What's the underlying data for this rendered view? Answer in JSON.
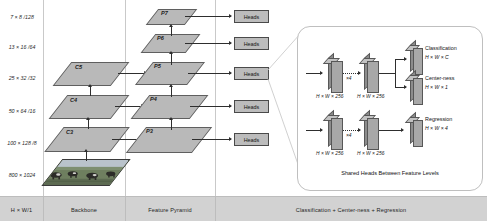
{
  "figure": {
    "accent_color": "#b9b9b9",
    "line_color": "#2e2e2e",
    "panel_border_color": "#bfbfbf"
  },
  "resolution_labels": [
    {
      "text": "7 × 8 /128"
    },
    {
      "text": "13 × 16 /64"
    },
    {
      "text": "25 × 32 /32"
    },
    {
      "text": "50 × 64 /16"
    },
    {
      "text": "100 × 128 /8"
    },
    {
      "text": "800 × 1024"
    }
  ],
  "backbone": {
    "levels": [
      {
        "label": "C5"
      },
      {
        "label": "C4"
      },
      {
        "label": "C3"
      }
    ],
    "input_image_alt": "input image"
  },
  "feature_pyramid": {
    "levels": [
      {
        "label": "P7"
      },
      {
        "label": "P6"
      },
      {
        "label": "P5"
      },
      {
        "label": "P4"
      },
      {
        "label": "P3"
      }
    ]
  },
  "heads": {
    "label": "Heads",
    "count": 5
  },
  "legend_bar": {
    "cells": [
      {
        "text": "H × W/1"
      },
      {
        "text": "Backbone"
      },
      {
        "text": "Feature Pyramid"
      },
      {
        "text": "Classification + Center-ness + Regression"
      }
    ]
  },
  "detail_panel": {
    "caption": "Shared Heads Between Feature Levels",
    "repeat_annotation": "×4",
    "dim_captions": [
      {
        "text": "H × W × 256"
      },
      {
        "text": "H × W × 256"
      },
      {
        "text": "H × W × 256"
      },
      {
        "text": "H × W × 256"
      }
    ],
    "outputs": [
      {
        "name": "Classification",
        "dim": "H × W × C"
      },
      {
        "name": "Center-ness",
        "dim": "H × W × 1"
      },
      {
        "name": "Regression",
        "dim": "H × W × 4"
      }
    ]
  }
}
